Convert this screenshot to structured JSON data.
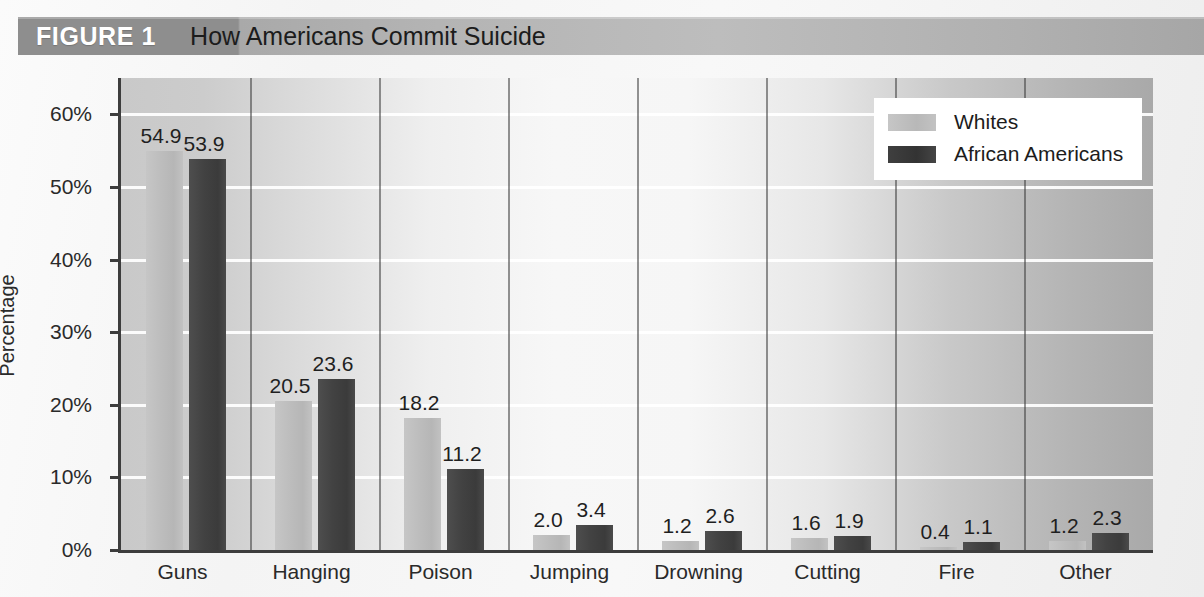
{
  "figure": {
    "label": "FIGURE 1",
    "title": "How Americans Commit Suicide"
  },
  "colors": {
    "whites_bar": "#bdbdbd",
    "african_americans_bar": "#424242",
    "title_bar_dark": "#8e8e8e",
    "axis": "#3d3d3d",
    "gridline": "#ffffff"
  },
  "chart_data": {
    "type": "bar",
    "title": "How Americans Commit Suicide",
    "xlabel": "",
    "ylabel": "Percentage",
    "ylim": [
      0,
      65
    ],
    "ytick_labels": [
      "0%",
      "10%",
      "20%",
      "30%",
      "40%",
      "50%",
      "60%"
    ],
    "ytick_values": [
      0,
      10,
      20,
      30,
      40,
      50,
      60
    ],
    "grid": true,
    "legend_position": "top-right",
    "categories": [
      "Guns",
      "Hanging",
      "Poison",
      "Jumping",
      "Drowning",
      "Cutting",
      "Fire",
      "Other"
    ],
    "series": [
      {
        "name": "Whites",
        "values": [
          54.9,
          20.5,
          18.2,
          2.0,
          1.2,
          1.6,
          0.4,
          1.2
        ],
        "labels": [
          "54.9",
          "20.5",
          "18.2",
          "2.0",
          "1.2",
          "1.6",
          "0.4",
          "1.2"
        ]
      },
      {
        "name": "African Americans",
        "values": [
          53.9,
          23.6,
          11.2,
          3.4,
          2.6,
          1.9,
          1.1,
          2.3
        ],
        "labels": [
          "53.9",
          "23.6",
          "11.2",
          "3.4",
          "2.6",
          "1.9",
          "1.1",
          "2.3"
        ]
      }
    ]
  }
}
